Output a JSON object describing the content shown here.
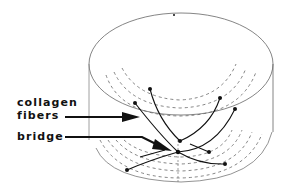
{
  "labels": {
    "collagen_line1": "collagen",
    "collagen_line2": "fibers",
    "bridge": "bridge"
  },
  "colors": {
    "ink": "#111111",
    "outline": "#555555",
    "dashed": "#666666",
    "background": "#ffffff"
  }
}
